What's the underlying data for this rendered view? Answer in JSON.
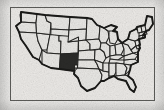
{
  "figure": {
    "kind": "map-thumbnail",
    "background_color": "#f0efed",
    "frame": {
      "color": "#5b5b58",
      "fill": "#eceae7",
      "x": 10,
      "y": 7,
      "width": 145,
      "height": 94
    }
  },
  "map": {
    "region": "Contiguous United States",
    "state_fill": "#e9e8e5",
    "state_border_color": "#262624",
    "national_outline_color": "#1a1a18",
    "highlight_fill": "#2b2b29",
    "highlighted_states": [
      "New Mexico"
    ],
    "highlight_label": "New Mexico",
    "states": [
      {
        "code": "WA",
        "name": "Washington",
        "highlighted": false
      },
      {
        "code": "OR",
        "name": "Oregon",
        "highlighted": false
      },
      {
        "code": "CA",
        "name": "California",
        "highlighted": false
      },
      {
        "code": "NV",
        "name": "Nevada",
        "highlighted": false
      },
      {
        "code": "ID",
        "name": "Idaho",
        "highlighted": false
      },
      {
        "code": "MT",
        "name": "Montana",
        "highlighted": false
      },
      {
        "code": "WY",
        "name": "Wyoming",
        "highlighted": false
      },
      {
        "code": "UT",
        "name": "Utah",
        "highlighted": false
      },
      {
        "code": "AZ",
        "name": "Arizona",
        "highlighted": false
      },
      {
        "code": "CO",
        "name": "Colorado",
        "highlighted": false
      },
      {
        "code": "NM",
        "name": "New Mexico",
        "highlighted": true
      },
      {
        "code": "ND",
        "name": "North Dakota",
        "highlighted": false
      },
      {
        "code": "SD",
        "name": "South Dakota",
        "highlighted": false
      },
      {
        "code": "NE",
        "name": "Nebraska",
        "highlighted": false
      },
      {
        "code": "KS",
        "name": "Kansas",
        "highlighted": false
      },
      {
        "code": "OK",
        "name": "Oklahoma",
        "highlighted": false
      },
      {
        "code": "TX",
        "name": "Texas",
        "highlighted": false
      },
      {
        "code": "MN",
        "name": "Minnesota",
        "highlighted": false
      },
      {
        "code": "IA",
        "name": "Iowa",
        "highlighted": false
      },
      {
        "code": "MO",
        "name": "Missouri",
        "highlighted": false
      },
      {
        "code": "AR",
        "name": "Arkansas",
        "highlighted": false
      },
      {
        "code": "LA",
        "name": "Louisiana",
        "highlighted": false
      },
      {
        "code": "WI",
        "name": "Wisconsin",
        "highlighted": false
      },
      {
        "code": "IL",
        "name": "Illinois",
        "highlighted": false
      },
      {
        "code": "MS",
        "name": "Mississippi",
        "highlighted": false
      },
      {
        "code": "AL",
        "name": "Alabama",
        "highlighted": false
      },
      {
        "code": "MI",
        "name": "Michigan",
        "highlighted": false
      },
      {
        "code": "IN",
        "name": "Indiana",
        "highlighted": false
      },
      {
        "code": "OH",
        "name": "Ohio",
        "highlighted": false
      },
      {
        "code": "KY",
        "name": "Kentucky",
        "highlighted": false
      },
      {
        "code": "TN",
        "name": "Tennessee",
        "highlighted": false
      },
      {
        "code": "GA",
        "name": "Georgia",
        "highlighted": false
      },
      {
        "code": "FL",
        "name": "Florida",
        "highlighted": false
      },
      {
        "code": "SC",
        "name": "South Carolina",
        "highlighted": false
      },
      {
        "code": "NC",
        "name": "North Carolina",
        "highlighted": false
      },
      {
        "code": "VA",
        "name": "Virginia",
        "highlighted": false
      },
      {
        "code": "WV",
        "name": "West Virginia",
        "highlighted": false
      },
      {
        "code": "PA",
        "name": "Pennsylvania",
        "highlighted": false
      },
      {
        "code": "NY",
        "name": "New York",
        "highlighted": false
      },
      {
        "code": "MD",
        "name": "Maryland",
        "highlighted": false
      },
      {
        "code": "DE",
        "name": "Delaware",
        "highlighted": false
      },
      {
        "code": "NJ",
        "name": "New Jersey",
        "highlighted": false
      },
      {
        "code": "CT",
        "name": "Connecticut",
        "highlighted": false
      },
      {
        "code": "RI",
        "name": "Rhode Island",
        "highlighted": false
      },
      {
        "code": "MA",
        "name": "Massachusetts",
        "highlighted": false
      },
      {
        "code": "VT",
        "name": "Vermont",
        "highlighted": false
      },
      {
        "code": "NH",
        "name": "New Hampshire",
        "highlighted": false
      },
      {
        "code": "ME",
        "name": "Maine",
        "highlighted": false
      }
    ]
  }
}
